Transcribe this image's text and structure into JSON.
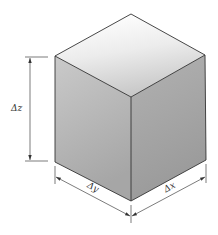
{
  "diagram": {
    "type": "isometric-cube-dimensioned",
    "labels": {
      "dz": "Δz",
      "dy": "Δy",
      "dx": "Δx"
    },
    "colors": {
      "top_face_light": "#ffffff",
      "top_face_dark": "#c6c6c6",
      "left_face_light": "#c8c8c8",
      "left_face_dark": "#a8a8a8",
      "right_face_light": "#b0b0b0",
      "right_face_dark": "#9a9a9a",
      "edge": "#333333",
      "dimension_line": "#444444"
    },
    "vertices": {
      "top": [
        131,
        14
      ],
      "left_top": [
        55,
        56
      ],
      "right_top": [
        205,
        55
      ],
      "front_top": [
        131,
        97
      ],
      "left_bottom": [
        55,
        162
      ],
      "right_bottom": [
        206,
        160
      ],
      "front_bottom": [
        131,
        201
      ]
    }
  }
}
